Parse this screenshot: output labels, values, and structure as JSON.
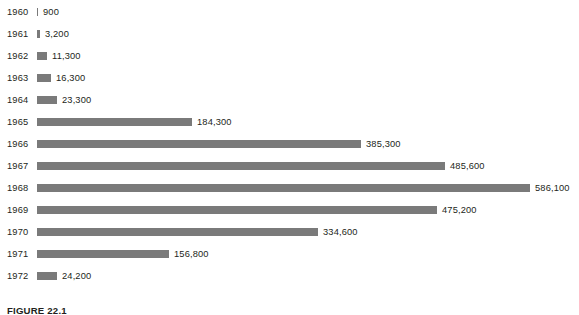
{
  "figure": {
    "caption": "FIGURE 22.1"
  },
  "chart_data": {
    "type": "bar",
    "orientation": "horizontal",
    "title": "",
    "subtitle": "",
    "xlabel": "",
    "ylabel": "",
    "grid": false,
    "legend": null,
    "axis_visible": false,
    "tick_labels_visible": false,
    "data_labels": true,
    "bar_color": "#7a7a7a",
    "text_color": "#231f20",
    "background": "#ffffff",
    "xlim": [
      0,
      586100
    ],
    "categories": [
      "1960",
      "1961",
      "1962",
      "1963",
      "1964",
      "1965",
      "1966",
      "1967",
      "1968",
      "1969",
      "1970",
      "1971",
      "1972"
    ],
    "values": [
      900,
      3200,
      11300,
      16300,
      23300,
      184300,
      385300,
      485600,
      586100,
      475200,
      334600,
      156800,
      24200
    ],
    "value_labels": [
      "900",
      "3,200",
      "11,300",
      "16,300",
      "23,300",
      "184,300",
      "385,300",
      "485,600",
      "586,100",
      "475,200",
      "334,600",
      "156,800",
      "24,200"
    ]
  }
}
